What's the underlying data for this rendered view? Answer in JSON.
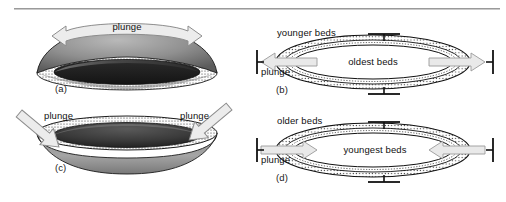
{
  "figure": {
    "type": "geologic-fold-diagram",
    "panels": [
      {
        "id": "a",
        "label": "(a)",
        "view": "block-diagram",
        "structure": "doubly plunging anticline",
        "annotations": [
          {
            "name": "plunge",
            "text": "plunge",
            "arrow": "curved double-headed, outward"
          }
        ]
      },
      {
        "id": "b",
        "label": "(b)",
        "view": "map-view",
        "structure": "plunging anticline",
        "annotations": [
          {
            "name": "younger-beds",
            "text": "younger beds"
          },
          {
            "name": "oldest-beds",
            "text": "oldest beds"
          },
          {
            "name": "plunge",
            "text": "plunge",
            "arrow": "double, pointing outward"
          }
        ],
        "symbols": [
          "strike-dip-top",
          "strike-dip-bottom",
          "plunge-tick-left",
          "plunge-tick-right"
        ]
      },
      {
        "id": "c",
        "label": "(c)",
        "view": "block-diagram",
        "structure": "basin / doubly plunging syncline",
        "annotations": [
          {
            "name": "plunge-left",
            "text": "plunge",
            "arrow": "straight, pointing down-right"
          },
          {
            "name": "plunge-right",
            "text": "plunge",
            "arrow": "straight, pointing down-left"
          }
        ]
      },
      {
        "id": "d",
        "label": "(d)",
        "view": "map-view",
        "structure": "plunging syncline",
        "annotations": [
          {
            "name": "older-beds",
            "text": "older beds"
          },
          {
            "name": "youngest-beds",
            "text": "youngest beds"
          },
          {
            "name": "plunge",
            "text": "plunge",
            "arrow": "double, pointing inward"
          }
        ],
        "symbols": [
          "strike-dip-top",
          "strike-dip-bottom",
          "plunge-tick-left",
          "plunge-tick-right"
        ]
      }
    ],
    "colors": {
      "ink": "#111111",
      "rule": "#9a9a9a",
      "arrow_fill": "#e8e8e8",
      "arrow_stroke": "#8d8d8d",
      "stipple": "#2a2a2a"
    }
  }
}
